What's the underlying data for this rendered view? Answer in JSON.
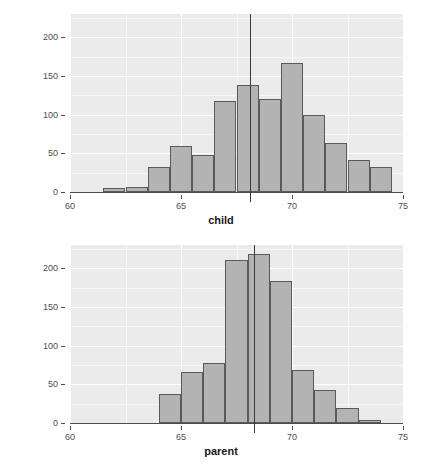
{
  "figure": {
    "background_color": "#ffffff",
    "panel_color": "#ebebeb",
    "bar_fill": "#b3b3b3",
    "bar_stroke": "#5a5a5a",
    "vline_color": "#3a3a3a",
    "grid_color": "#ffffff"
  },
  "chart_data": [
    {
      "type": "bar",
      "name": "child-histogram",
      "title": "",
      "xlabel": "child",
      "ylabel": "",
      "xlim": [
        60,
        75
      ],
      "ylim": [
        0,
        230
      ],
      "grid": true,
      "legend": "none",
      "bin_width": 0.5,
      "bin_starts": [
        61.0,
        61.5,
        62.0,
        62.5,
        63.0,
        63.5,
        64.0,
        64.5,
        65.0,
        65.5,
        66.0,
        66.5,
        67.0,
        67.5,
        68.0,
        68.5,
        69.0,
        69.5,
        70.0,
        70.5,
        71.0,
        71.5,
        72.0,
        72.5,
        73.0
      ],
      "categories": [
        "61.0",
        "61.5",
        "62.0",
        "62.5",
        "63.0",
        "63.5",
        "64.0",
        "64.5",
        "65.0",
        "65.5",
        "66.0",
        "66.5",
        "67.0",
        "67.5",
        "68.0",
        "68.5",
        "69.0",
        "69.5",
        "70.0",
        "70.5",
        "71.0",
        "71.5",
        "72.0",
        "72.5",
        "73.0"
      ],
      "values": [
        0,
        0,
        5,
        7,
        32,
        59,
        48,
        117,
        138,
        120,
        167,
        99,
        63,
        41,
        32,
        0,
        0,
        0,
        0,
        0,
        0,
        0,
        0,
        0,
        0
      ],
      "bars": [
        {
          "x0": 61.5,
          "x1": 62.5,
          "value": 5
        },
        {
          "x0": 62.5,
          "x1": 63.5,
          "value": 7
        },
        {
          "x0": 63.5,
          "x1": 64.5,
          "value": 32
        },
        {
          "x0": 64.5,
          "x1": 65.5,
          "value": 59
        },
        {
          "x0": 65.5,
          "x1": 66.5,
          "value": 48
        },
        {
          "x0": 66.5,
          "x1": 67.5,
          "value": 117
        },
        {
          "x0": 67.5,
          "x1": 68.5,
          "value": 138
        },
        {
          "x0": 68.5,
          "x1": 69.5,
          "value": 120
        },
        {
          "x0": 69.5,
          "x1": 70.5,
          "value": 167
        },
        {
          "x0": 70.5,
          "x1": 71.5,
          "value": 99
        },
        {
          "x0": 71.5,
          "x1": 72.5,
          "value": 63
        },
        {
          "x0": 72.5,
          "x1": 73.5,
          "value": 41
        },
        {
          "x0": 73.5,
          "x1": 74.5,
          "value": 32
        }
      ],
      "vline_x": 68.09,
      "vline_top": 230,
      "yticks": [
        0,
        50,
        100,
        150,
        200
      ],
      "ytick_labels": [
        "0",
        "50",
        "100",
        "150",
        "200"
      ],
      "xticks": [
        60,
        65,
        70,
        75
      ],
      "xtick_labels": [
        "60",
        "65",
        "70",
        "75"
      ],
      "yminor": [
        25,
        75,
        125,
        175,
        225
      ],
      "xminor": [
        62.5,
        67.5,
        72.5
      ]
    },
    {
      "type": "bar",
      "name": "parent-histogram",
      "title": "",
      "xlabel": "parent",
      "ylabel": "",
      "xlim": [
        60,
        75
      ],
      "ylim": [
        0,
        230
      ],
      "grid": true,
      "legend": "none",
      "bin_width": 0.5,
      "bin_starts": [
        64.0,
        64.5,
        65.0,
        65.5,
        66.0,
        66.5,
        67.0,
        67.5,
        68.0,
        68.5,
        69.0,
        69.5,
        70.0,
        70.5,
        71.0,
        71.5,
        72.0,
        72.5,
        73.0
      ],
      "categories": [
        "64.0",
        "64.5",
        "65.0",
        "65.5",
        "66.0",
        "66.5",
        "67.0",
        "67.5",
        "68.0",
        "68.5",
        "69.0",
        "69.5",
        "70.0",
        "70.5",
        "71.0",
        "71.5",
        "72.0",
        "72.5",
        "73.0"
      ],
      "values": [
        37,
        66,
        78,
        211,
        219,
        183,
        68,
        43,
        19,
        4,
        0,
        0,
        0,
        0,
        0,
        0,
        0,
        0,
        0
      ],
      "bars": [
        {
          "x0": 64.0,
          "x1": 65.0,
          "value": 37
        },
        {
          "x0": 65.0,
          "x1": 66.0,
          "value": 66
        },
        {
          "x0": 66.0,
          "x1": 67.0,
          "value": 78
        },
        {
          "x0": 67.0,
          "x1": 68.0,
          "value": 211
        },
        {
          "x0": 68.0,
          "x1": 69.0,
          "value": 219
        },
        {
          "x0": 69.0,
          "x1": 70.0,
          "value": 183
        },
        {
          "x0": 70.0,
          "x1": 71.0,
          "value": 68
        },
        {
          "x0": 71.0,
          "x1": 72.0,
          "value": 43
        },
        {
          "x0": 72.0,
          "x1": 73.0,
          "value": 19
        },
        {
          "x0": 73.0,
          "x1": 74.0,
          "value": 4
        }
      ],
      "vline_x": 68.31,
      "vline_top": 230,
      "yticks": [
        0,
        50,
        100,
        150,
        200
      ],
      "ytick_labels": [
        "0",
        "50",
        "100",
        "150",
        "200"
      ],
      "xticks": [
        60,
        65,
        70,
        75
      ],
      "xtick_labels": [
        "60",
        "65",
        "70",
        "75"
      ],
      "yminor": [
        25,
        75,
        125,
        175,
        225
      ],
      "xminor": [
        62.5,
        67.5,
        72.5
      ]
    }
  ]
}
